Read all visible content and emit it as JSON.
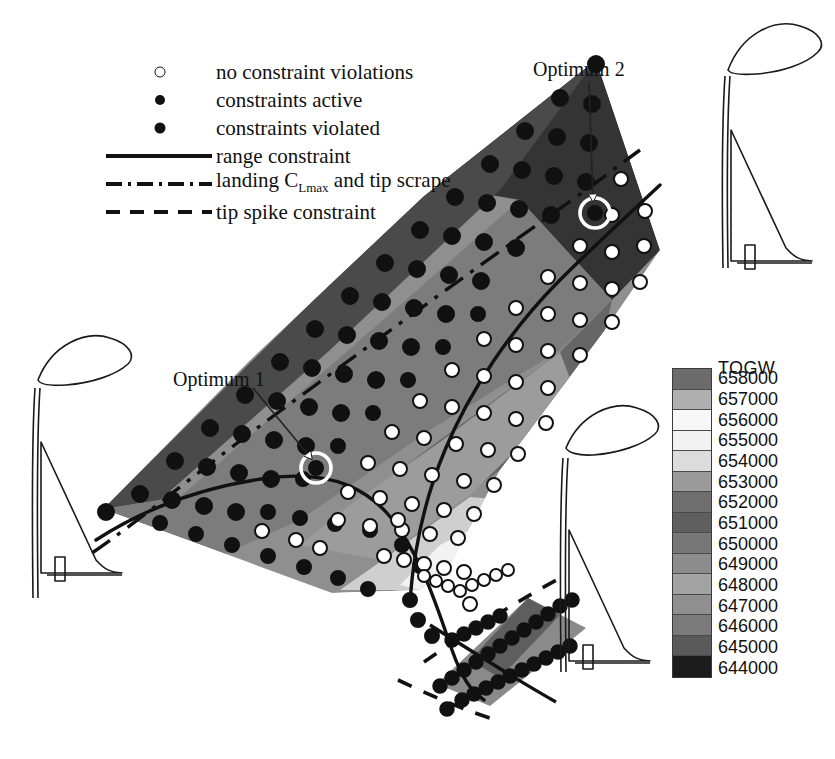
{
  "figure": {
    "domain": "aircraft-design-space",
    "background": "#ffffff"
  },
  "legend": {
    "items": [
      {
        "symbol": "open-circle",
        "label": "no constraint violations"
      },
      {
        "symbol": "filled-circle-small",
        "label": "constraints active"
      },
      {
        "symbol": "filled-circle-large",
        "label": "constraints violated"
      },
      {
        "symbol": "solid-line",
        "label": "range constraint"
      },
      {
        "symbol": "dash-dot-line",
        "label_pre": "landing C",
        "label_sub": "Lmax",
        "label_post": " and tip scrape"
      },
      {
        "symbol": "dashed-line",
        "label": "tip spike constraint"
      }
    ]
  },
  "annotations": {
    "optimum1": "Optimum 1",
    "optimum2": "Optimum 2"
  },
  "colorbar": {
    "title": "TOGW",
    "ticks": [
      "658000",
      "657000",
      "656000",
      "655000",
      "654000",
      "653000",
      "652000",
      "651000",
      "650000",
      "649000",
      "648000",
      "647000",
      "646000",
      "645000",
      "644000"
    ],
    "band_colors": [
      "#6b6b6b",
      "#b0b0b0",
      "#f7f7f7",
      "#f2f2f2",
      "#dcdcdc",
      "#9a9a9a",
      "#6e6e6e",
      "#5f5f5f",
      "#777777",
      "#8c8c8c",
      "#a3a3a3",
      "#8f8f8f",
      "#7a7a7a",
      "#5a5a5a",
      "#1c1c1c"
    ]
  },
  "chart_data": {
    "type": "scatter",
    "title": "",
    "xlabel": "",
    "ylabel": "",
    "legend_position": "top-left",
    "colorbar_variable": "TOGW",
    "colorbar_range": [
      644000,
      658000
    ],
    "colorbar_step": 1000,
    "marker_classes": [
      {
        "name": "no constraint violations",
        "style": "open-circle"
      },
      {
        "name": "constraints active",
        "style": "filled-circle-small"
      },
      {
        "name": "constraints violated",
        "style": "filled-circle-large"
      }
    ],
    "constraint_curves": [
      {
        "name": "range constraint",
        "style": "solid"
      },
      {
        "name": "landing CLmax and tip scrape",
        "style": "dash-dot"
      },
      {
        "name": "tip spike constraint",
        "style": "dashed"
      }
    ],
    "optima": [
      {
        "label": "Optimum 1",
        "px": [
          316,
          468
        ]
      },
      {
        "label": "Optimum 2",
        "px": [
          595,
          213
        ]
      }
    ],
    "contour_bands": [
      {
        "level": 658000,
        "color": "#6b6b6b"
      },
      {
        "level": 657000,
        "color": "#b0b0b0"
      },
      {
        "level": 656000,
        "color": "#f7f7f7"
      },
      {
        "level": 655000,
        "color": "#f2f2f2"
      },
      {
        "level": 654000,
        "color": "#dcdcdc"
      },
      {
        "level": 653000,
        "color": "#9a9a9a"
      },
      {
        "level": 652000,
        "color": "#6e6e6e"
      },
      {
        "level": 651000,
        "color": "#5f5f5f"
      },
      {
        "level": 650000,
        "color": "#777777"
      },
      {
        "level": 649000,
        "color": "#8c8c8c"
      },
      {
        "level": 648000,
        "color": "#a3a3a3"
      },
      {
        "level": 647000,
        "color": "#8f8f8f"
      },
      {
        "level": 646000,
        "color": "#7a7a7a"
      },
      {
        "level": 645000,
        "color": "#5a5a5a"
      },
      {
        "level": 644000,
        "color": "#1c1c1c"
      }
    ],
    "aircraft_sketches": 4
  }
}
